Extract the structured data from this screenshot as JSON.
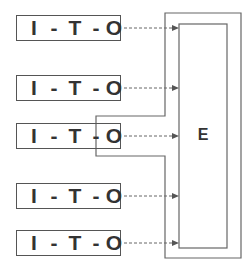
{
  "diagram": {
    "nodes": [
      {
        "id": "ito-1",
        "parts": [
          "I",
          "-",
          "T",
          "-",
          "O"
        ]
      },
      {
        "id": "ito-2",
        "parts": [
          "I",
          "-",
          "T",
          "-",
          "O"
        ]
      },
      {
        "id": "ito-3",
        "parts": [
          "I",
          "-",
          "T",
          "-",
          "O"
        ]
      },
      {
        "id": "ito-4",
        "parts": [
          "I",
          "-",
          "T",
          "-",
          "O"
        ]
      },
      {
        "id": "ito-5",
        "parts": [
          "I",
          "-",
          "T",
          "-",
          "O"
        ]
      }
    ],
    "target": {
      "label": "E"
    },
    "edges": [
      {
        "from": "ito-1",
        "to": "E",
        "style": "dashed-arrow"
      },
      {
        "from": "ito-2",
        "to": "E",
        "style": "dashed-arrow"
      },
      {
        "from": "ito-3",
        "to": "E",
        "style": "dashed-arrow"
      },
      {
        "from": "ito-4",
        "to": "E",
        "style": "dashed-arrow"
      },
      {
        "from": "ito-5",
        "to": "E",
        "style": "dashed-arrow"
      }
    ],
    "colors": {
      "stroke": "#555555",
      "text": "#333333",
      "background": "#ffffff"
    }
  }
}
